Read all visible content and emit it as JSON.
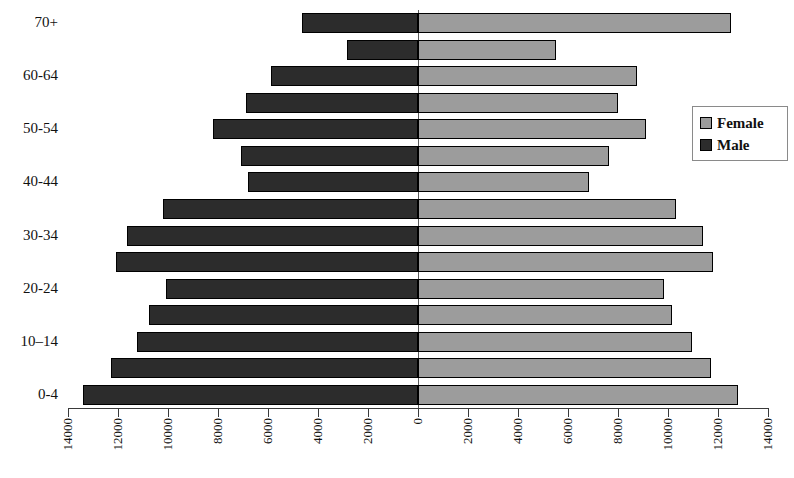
{
  "chart_data": {
    "type": "bar",
    "subtype": "population-pyramid",
    "title": "",
    "xlabel": "",
    "ylabel": "",
    "orientation": "horizontal",
    "categories": [
      "0-4",
      "5-9",
      "10–14",
      "15-19",
      "20-24",
      "25-29",
      "30-34",
      "35-39",
      "40-44",
      "45-49",
      "50-54",
      "55-59",
      "60-64",
      "65-69",
      "70+"
    ],
    "visible_category_labels": [
      "0-4",
      "10–14",
      "20-24",
      "30-34",
      "40-44",
      "50-54",
      "60-64",
      "70+"
    ],
    "series": [
      {
        "name": "Male",
        "color": "#2c2c2c",
        "side": "left",
        "values": [
          13400,
          12300,
          11250,
          10750,
          10100,
          12100,
          11650,
          10200,
          6800,
          7100,
          8200,
          6900,
          5900,
          2850,
          4650
        ]
      },
      {
        "name": "Female",
        "color": "#9c9c9c",
        "side": "right",
        "values": [
          12800,
          11700,
          10950,
          10150,
          9850,
          11800,
          11400,
          10300,
          6850,
          7650,
          9100,
          8000,
          8750,
          5500,
          12500
        ]
      }
    ],
    "xlim": [
      -14000,
      14000
    ],
    "x_tick_values": [
      -14000,
      -12000,
      -10000,
      -8000,
      -6000,
      -4000,
      -2000,
      0,
      2000,
      4000,
      6000,
      8000,
      10000,
      12000,
      14000
    ],
    "x_tick_labels": [
      "14000",
      "12000",
      "10000",
      "8000",
      "6000",
      "4000",
      "2000",
      "0",
      "2000",
      "4000",
      "6000",
      "8000",
      "10000",
      "12000",
      "14000"
    ],
    "grid": false,
    "legend_position": "right",
    "legend_entries": [
      "Female",
      "Male"
    ]
  },
  "legend": {
    "female_label": "Female",
    "male_label": "Male",
    "female_color": "#9c9c9c",
    "male_color": "#2c2c2c"
  }
}
